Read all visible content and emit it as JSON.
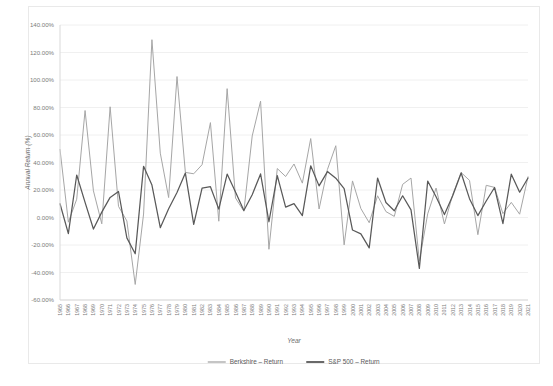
{
  "chart_data": {
    "type": "line",
    "title": "",
    "xlabel": "Year",
    "ylabel": "Annual Return (%)",
    "ylim": [
      -60,
      140
    ],
    "ytick_step": 20,
    "ytick_labels": [
      "140.00%",
      "120.00%",
      "100.00%",
      "80.00%",
      "60.00%",
      "40.00%",
      "20.00%",
      "0.00%",
      "-20.00%",
      "-40.00%",
      "-60.00%"
    ],
    "grid": true,
    "legend_position": "bottom",
    "x": [
      1965,
      1966,
      1967,
      1968,
      1969,
      1970,
      1971,
      1972,
      1973,
      1974,
      1975,
      1976,
      1977,
      1978,
      1979,
      1980,
      1981,
      1982,
      1983,
      1984,
      1985,
      1986,
      1987,
      1988,
      1989,
      1990,
      1991,
      1992,
      1993,
      1994,
      1995,
      1996,
      1997,
      1998,
      1999,
      2000,
      2001,
      2002,
      2003,
      2004,
      2005,
      2006,
      2007,
      2008,
      2009,
      2010,
      2011,
      2012,
      2013,
      2014,
      2015,
      2016,
      2017,
      2018,
      2019,
      2020,
      2021
    ],
    "categories": [
      "1965",
      "1966",
      "1967",
      "1968",
      "1969",
      "1970",
      "1971",
      "1972",
      "1973",
      "1974",
      "1975",
      "1976",
      "1977",
      "1978",
      "1979",
      "1980",
      "1981",
      "1982",
      "1983",
      "1984",
      "1985",
      "1986",
      "1987",
      "1988",
      "1989",
      "1990",
      "1991",
      "1992",
      "1993",
      "1994",
      "1995",
      "1996",
      "1997",
      "1998",
      "1999",
      "2000",
      "2001",
      "2002",
      "2003",
      "2004",
      "2005",
      "2006",
      "2007",
      "2008",
      "2009",
      "2010",
      "2011",
      "2012",
      "2013",
      "2014",
      "2015",
      "2016",
      "2017",
      "2018",
      "2019",
      "2020",
      "2021"
    ],
    "series": [
      {
        "name": "Berkshire – Return",
        "color": "#a6a6a6",
        "values": [
          49.5,
          -3.4,
          13.3,
          77.8,
          19.4,
          -4.6,
          80.5,
          8.1,
          -2.5,
          -48.7,
          2.5,
          129.3,
          46.8,
          14.5,
          102.5,
          32.8,
          31.8,
          38.4,
          69.0,
          -2.7,
          93.7,
          14.2,
          4.6,
          59.3,
          84.6,
          -23.1,
          35.6,
          29.8,
          38.9,
          25.0,
          57.4,
          6.2,
          34.9,
          52.2,
          -19.9,
          26.6,
          6.5,
          -3.8,
          15.8,
          4.3,
          0.8,
          24.1,
          28.7,
          -31.8,
          2.7,
          21.4,
          -4.7,
          16.8,
          32.7,
          27.0,
          -12.5,
          23.4,
          21.9,
          2.8,
          11.0,
          2.4,
          29.6
        ]
      },
      {
        "name": "S&P 500 – Return",
        "color": "#595959",
        "values": [
          10.0,
          -11.7,
          30.9,
          11.0,
          -8.4,
          3.9,
          14.6,
          18.9,
          -14.8,
          -26.4,
          37.2,
          23.6,
          -7.4,
          6.4,
          18.2,
          32.3,
          -5.0,
          21.4,
          22.4,
          6.1,
          31.6,
          18.6,
          5.1,
          16.6,
          31.7,
          -3.1,
          30.5,
          7.6,
          10.1,
          1.3,
          37.6,
          23.0,
          33.4,
          28.6,
          21.0,
          -9.1,
          -11.9,
          -22.1,
          28.7,
          10.9,
          4.9,
          15.8,
          5.5,
          -37.0,
          26.5,
          15.1,
          2.1,
          16.0,
          32.4,
          13.7,
          1.4,
          12.0,
          21.8,
          -4.4,
          31.5,
          18.4,
          28.7
        ]
      }
    ]
  },
  "legend": {
    "items": [
      {
        "label": "Berkshire – Return",
        "color": "#a6a6a6"
      },
      {
        "label": "S&P 500 – Return",
        "color": "#595959"
      }
    ]
  }
}
